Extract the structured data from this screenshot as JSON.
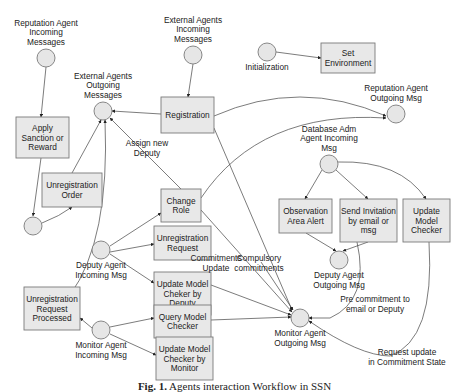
{
  "diagram": {
    "places": [
      {
        "id": "reputation-agent-incoming",
        "cx": 46,
        "cy": 58,
        "label": [
          "Reputation Agent",
          "Incoming",
          "Messages"
        ],
        "label_pos": "above"
      },
      {
        "id": "external-agents-outgoing",
        "cx": 103,
        "cy": 111,
        "label": [
          "External Agents",
          "Outgoing",
          "Messages"
        ],
        "label_pos": "above"
      },
      {
        "id": "external-agents-incoming",
        "cx": 193,
        "cy": 55,
        "label": [
          "External Agents",
          "Incoming",
          "Messages"
        ],
        "label_pos": "above"
      },
      {
        "id": "initialization",
        "cx": 267,
        "cy": 52,
        "label": [
          "Initialization"
        ],
        "label_pos": "below"
      },
      {
        "id": "reputation-agent-outgoing",
        "cx": 396,
        "cy": 114,
        "label": [
          "Reputation Agent",
          "Outgoing Msg"
        ],
        "label_pos": "above"
      },
      {
        "id": "database-adm-incoming",
        "cx": 329,
        "cy": 164,
        "label": [
          "Database Adm",
          "Agent Incoming",
          "Msg"
        ],
        "label_pos": "above"
      },
      {
        "id": "unregistration-buffer",
        "cx": 33,
        "cy": 226,
        "label": [],
        "label_pos": "none"
      },
      {
        "id": "deputy-agent-incoming",
        "cx": 101,
        "cy": 250,
        "label": [
          "Deputy Agent",
          "Incoming Msg"
        ],
        "label_pos": "below"
      },
      {
        "id": "deputy-agent-outgoing",
        "cx": 339,
        "cy": 260,
        "label": [
          "Deputy Agent",
          "Outgoing Msg"
        ],
        "label_pos": "below"
      },
      {
        "id": "monitor-agent-incoming",
        "cx": 101,
        "cy": 330,
        "label": [
          "Monitor Agent",
          "Incoming Msg"
        ],
        "label_pos": "below"
      },
      {
        "id": "monitor-agent-outgoing",
        "cx": 300,
        "cy": 318,
        "label": [
          "Monitor Agent",
          "Outgoing Msg"
        ],
        "label_pos": "below"
      }
    ],
    "transitions": [
      {
        "id": "set-environment",
        "x": 321,
        "y": 43,
        "w": 54,
        "h": 30,
        "label": [
          "Set",
          "Environment"
        ]
      },
      {
        "id": "registration",
        "x": 161,
        "y": 97,
        "w": 53,
        "h": 36,
        "label": [
          "Registration"
        ]
      },
      {
        "id": "apply-sanction",
        "x": 16,
        "y": 117,
        "w": 53,
        "h": 41,
        "label": [
          "Apply",
          "Sanction or",
          "Reward"
        ]
      },
      {
        "id": "unregistration-order",
        "x": 42,
        "y": 173,
        "w": 60,
        "h": 34,
        "label": [
          "Unregistration",
          "Order"
        ]
      },
      {
        "id": "change-role",
        "x": 161,
        "y": 189,
        "w": 40,
        "h": 33,
        "label": [
          "Change",
          "Role"
        ]
      },
      {
        "id": "observation-area-alert",
        "x": 279,
        "y": 199,
        "w": 53,
        "h": 34,
        "label": [
          "Observation",
          "Area Alert"
        ]
      },
      {
        "id": "send-invitation",
        "x": 340,
        "y": 199,
        "w": 57,
        "h": 43,
        "label": [
          "Send Invitation",
          "by email or",
          "msg"
        ]
      },
      {
        "id": "update-model-checker",
        "x": 403,
        "y": 199,
        "w": 47,
        "h": 43,
        "label": [
          "Update",
          "Model",
          "Checker"
        ]
      },
      {
        "id": "unregistration-request",
        "x": 154,
        "y": 226,
        "w": 57,
        "h": 34,
        "label": [
          "Unregistration",
          "Request"
        ]
      },
      {
        "id": "update-model-deputy",
        "x": 154,
        "y": 272,
        "w": 57,
        "h": 43,
        "label": [
          "Update Model",
          "Cheker by",
          "Deputy"
        ]
      },
      {
        "id": "unregistration-processed",
        "x": 24,
        "y": 287,
        "w": 56,
        "h": 43,
        "label": [
          "Unregistration",
          "Request",
          "Processed"
        ]
      },
      {
        "id": "query-model-checker",
        "x": 154,
        "y": 305,
        "w": 57,
        "h": 33,
        "label": [
          "Query Model",
          "Checker"
        ]
      },
      {
        "id": "update-model-monitor",
        "x": 156,
        "y": 337,
        "w": 57,
        "h": 43,
        "label": [
          "Update Model",
          "Checker by",
          "Monitor"
        ]
      }
    ],
    "edge_labels": [
      {
        "id": "assign-new-deputy",
        "x": 147,
        "y": 146,
        "lines": [
          "Assign new",
          "Deputy"
        ]
      },
      {
        "id": "compulsory-commitments",
        "x": 259,
        "y": 261,
        "lines": [
          "Compulsory",
          "commitments"
        ]
      },
      {
        "id": "commitments-update",
        "x": 216,
        "y": 261,
        "lines": [
          "Commitments",
          "Update"
        ]
      },
      {
        "id": "pre-commitment",
        "x": 375,
        "y": 302,
        "lines": [
          "Pre commitment to",
          "email or Deputy"
        ]
      },
      {
        "id": "request-update",
        "x": 407,
        "y": 355,
        "lines": [
          "Request update",
          "in Commitment State"
        ]
      }
    ],
    "edges": [
      {
        "d": "M46,67 L41,117",
        "arrow": true
      },
      {
        "d": "M193,64 L188,97",
        "arrow": true
      },
      {
        "d": "M276,52 L321,58",
        "arrow": true
      },
      {
        "d": "M161,114 L112,111",
        "arrow": true
      },
      {
        "d": "M41,158 L33,216",
        "arrow": true
      },
      {
        "d": "M42,223 Q60,216 72,207",
        "arrow": true
      },
      {
        "d": "M72,173 L101,120",
        "arrow": true
      },
      {
        "d": "M70,295 Q110,240 105,120",
        "arrow": true
      },
      {
        "d": "M181,189 L110,118",
        "arrow": true
      },
      {
        "d": "M214,116 Q300,78 386,116",
        "arrow": true
      },
      {
        "d": "M201,198 Q260,110 386,118",
        "arrow": true
      },
      {
        "d": "M214,128 L292,310",
        "arrow": true
      },
      {
        "d": "M110,246 L161,213",
        "arrow": true
      },
      {
        "d": "M110,252 L154,244",
        "arrow": true
      },
      {
        "d": "M110,254 L154,283",
        "arrow": true
      },
      {
        "d": "M201,210 L292,312",
        "arrow": true
      },
      {
        "d": "M211,285 L291,315",
        "arrow": true
      },
      {
        "d": "M211,320 L291,317",
        "arrow": true
      },
      {
        "d": "M261,262 L293,310",
        "arrow": true
      },
      {
        "d": "M92,328 L80,318",
        "arrow": true
      },
      {
        "d": "M110,327 L154,318",
        "arrow": true
      },
      {
        "d": "M110,334 L156,355",
        "arrow": true
      },
      {
        "d": "M322,170 L305,199",
        "arrow": true
      },
      {
        "d": "M336,170 L368,199",
        "arrow": true
      },
      {
        "d": "M338,162 Q400,160 426,199",
        "arrow": true
      },
      {
        "d": "M306,233 L336,251",
        "arrow": true
      },
      {
        "d": "M368,242 L343,251",
        "arrow": true
      },
      {
        "d": "M357,242 Q370,300 330,318 L309,318",
        "arrow": true
      },
      {
        "d": "M429,242 Q435,340 390,356 Q360,356 309,321",
        "arrow": true
      }
    ]
  },
  "caption": {
    "prefix": "Fig. 1.",
    "text": " Agents interaction Workflow in SSN"
  }
}
